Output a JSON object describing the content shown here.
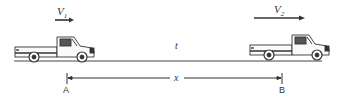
{
  "diagram": {
    "vehicles": [
      {
        "id": "truck-1",
        "velocity_label": "V",
        "velocity_sub": "1"
      },
      {
        "id": "truck-2",
        "velocity_label": "V",
        "velocity_sub": "2"
      }
    ],
    "time_label": "t",
    "distance_label": "x",
    "points": {
      "start": "A",
      "end": "B"
    }
  }
}
